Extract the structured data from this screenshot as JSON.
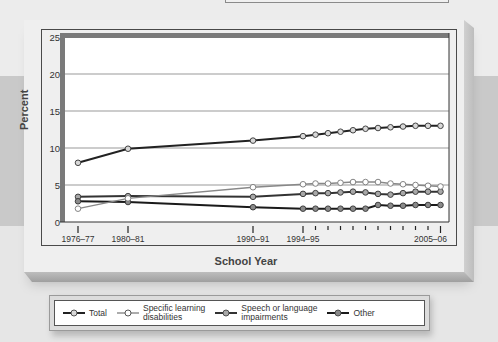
{
  "chart_data": {
    "type": "line",
    "title": "",
    "xlabel": "School Year",
    "ylabel": "Percent",
    "ylim": [
      0,
      25
    ],
    "yticks": [
      0,
      5,
      10,
      15,
      20,
      25
    ],
    "grid": true,
    "legend_position": "bottom",
    "x": [
      "1976-77",
      "1980-81",
      "1990-91",
      "1994-95",
      "1995-96",
      "1996-97",
      "1997-98",
      "1998-99",
      "1999-00",
      "2000-01",
      "2001-02",
      "2002-03",
      "2003-04",
      "2004-05",
      "2005-06"
    ],
    "xtick_labels": [
      "1976–77",
      "1980–81",
      "1990–91",
      "1994–95",
      "2005–06"
    ],
    "series": [
      {
        "name": "Total",
        "line_color": "#222222",
        "marker_fill": "#d8d8d8",
        "values": [
          8.0,
          9.9,
          11.0,
          11.6,
          11.8,
          12.0,
          12.2,
          12.4,
          12.6,
          12.7,
          12.8,
          12.9,
          13.0,
          13.0,
          13.0
        ]
      },
      {
        "name": "Specific learning disabilities",
        "line_color": "#888888",
        "marker_fill": "#ffffff",
        "values": [
          1.8,
          3.2,
          4.7,
          5.1,
          5.2,
          5.2,
          5.3,
          5.4,
          5.4,
          5.4,
          5.2,
          5.1,
          5.0,
          4.9,
          4.8
        ]
      },
      {
        "name": "Speech or language impairments",
        "line_color": "#333333",
        "marker_fill": "#a8a8a8",
        "values": [
          3.4,
          3.5,
          3.4,
          3.8,
          3.9,
          3.9,
          4.0,
          4.1,
          4.0,
          3.8,
          3.7,
          3.9,
          4.1,
          4.1,
          4.1
        ]
      },
      {
        "name": "Other",
        "line_color": "#1a1a1a",
        "marker_fill": "#8a8a8a",
        "values": [
          2.8,
          2.7,
          2.0,
          1.8,
          1.8,
          1.8,
          1.8,
          1.8,
          1.8,
          2.3,
          2.2,
          2.2,
          2.3,
          2.3,
          2.3
        ]
      }
    ]
  },
  "legend": {
    "items": [
      {
        "label_line1": "Total",
        "label_line2": ""
      },
      {
        "label_line1": "Specific learning",
        "label_line2": "disabilities"
      },
      {
        "label_line1": "Speech or language",
        "label_line2": "impairments"
      },
      {
        "label_line1": "Other",
        "label_line2": ""
      }
    ]
  }
}
